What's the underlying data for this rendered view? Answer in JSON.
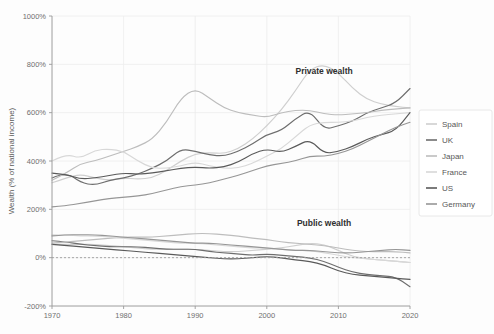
{
  "chart_data": {
    "type": "line",
    "title": "",
    "xlabel": "",
    "ylabel": "Wealth (% of national income)",
    "xlim": [
      1970,
      2020
    ],
    "ylim": [
      -200,
      1000
    ],
    "grid": true,
    "legend_position": "right",
    "x_ticks": [
      "1970",
      "1980",
      "1990",
      "2000",
      "2010",
      "2020"
    ],
    "x_tick_values": [
      1970,
      1980,
      1990,
      2000,
      2010,
      2020
    ],
    "y_ticks": [
      "-200%",
      "0%",
      "200%",
      "400%",
      "600%",
      "800%",
      "1000%"
    ],
    "y_tick_values": [
      -200,
      0,
      200,
      400,
      600,
      800,
      1000
    ],
    "annotations": [
      {
        "text": "Private wealth",
        "x": 2008,
        "y": 760
      },
      {
        "text": "Public wealth",
        "x": 2008,
        "y": 130
      }
    ],
    "zero_reference_line": 0,
    "colors": {
      "Spain": "#cfcfcf",
      "UK": "#6e6e6e",
      "Japan": "#bdbdbd",
      "France": "#d8d8d8",
      "US": "#5a5a5a",
      "Germany": "#969696"
    },
    "legend": [
      "Spain",
      "UK",
      "Japan",
      "France",
      "US",
      "Germany"
    ],
    "x": [
      1970,
      1972,
      1974,
      1976,
      1978,
      1980,
      1982,
      1984,
      1986,
      1988,
      1990,
      1992,
      1994,
      1996,
      1998,
      2000,
      2002,
      2004,
      2006,
      2008,
      2010,
      2012,
      2014,
      2016,
      2018,
      2020
    ],
    "series": [
      {
        "name": "Spain",
        "group": "private",
        "values": [
          310,
          330,
          345,
          330,
          320,
          330,
          325,
          330,
          360,
          400,
          430,
          435,
          430,
          450,
          490,
          545,
          610,
          690,
          780,
          800,
          765,
          700,
          655,
          635,
          625,
          620
        ]
      },
      {
        "name": "UK",
        "group": "private",
        "values": [
          330,
          355,
          310,
          300,
          320,
          330,
          345,
          370,
          400,
          450,
          440,
          425,
          420,
          440,
          470,
          510,
          525,
          575,
          610,
          530,
          545,
          565,
          600,
          620,
          640,
          700
        ]
      },
      {
        "name": "Japan",
        "group": "private",
        "values": [
          320,
          350,
          390,
          400,
          420,
          440,
          460,
          490,
          560,
          660,
          700,
          660,
          620,
          600,
          590,
          580,
          600,
          610,
          610,
          595,
          590,
          595,
          600,
          610,
          615,
          620
        ]
      },
      {
        "name": "France",
        "group": "private",
        "values": [
          400,
          430,
          410,
          445,
          450,
          440,
          400,
          370,
          370,
          380,
          395,
          380,
          370,
          370,
          390,
          420,
          450,
          500,
          550,
          560,
          560,
          565,
          580,
          590,
          595,
          600
        ]
      },
      {
        "name": "US",
        "group": "private",
        "values": [
          350,
          345,
          325,
          330,
          340,
          350,
          345,
          350,
          360,
          370,
          375,
          370,
          375,
          395,
          430,
          450,
          435,
          460,
          490,
          430,
          440,
          460,
          490,
          510,
          525,
          600
        ]
      },
      {
        "name": "Germany",
        "group": "private",
        "values": [
          210,
          215,
          225,
          235,
          245,
          250,
          255,
          265,
          280,
          295,
          300,
          310,
          325,
          340,
          360,
          380,
          390,
          400,
          420,
          420,
          430,
          450,
          480,
          510,
          540,
          560
        ]
      },
      {
        "name": "Spain",
        "group": "public",
        "values": [
          55,
          55,
          55,
          55,
          50,
          45,
          40,
          35,
          35,
          35,
          35,
          30,
          25,
          25,
          30,
          35,
          40,
          50,
          60,
          55,
          30,
          5,
          -5,
          -10,
          -15,
          -20
        ]
      },
      {
        "name": "UK",
        "group": "public",
        "values": [
          70,
          65,
          55,
          50,
          45,
          45,
          45,
          40,
          35,
          35,
          35,
          25,
          20,
          15,
          10,
          15,
          10,
          5,
          0,
          -15,
          -40,
          -60,
          -70,
          -75,
          -80,
          -120
        ]
      },
      {
        "name": "Japan",
        "group": "public",
        "values": [
          60,
          65,
          70,
          75,
          80,
          85,
          85,
          85,
          90,
          95,
          100,
          100,
          95,
          90,
          80,
          75,
          65,
          60,
          55,
          50,
          40,
          30,
          25,
          25,
          25,
          20
        ]
      },
      {
        "name": "France",
        "group": "public",
        "values": [
          95,
          95,
          90,
          90,
          85,
          80,
          75,
          70,
          65,
          60,
          60,
          55,
          50,
          45,
          40,
          40,
          35,
          30,
          30,
          20,
          10,
          0,
          -5,
          -10,
          -15,
          -20
        ]
      },
      {
        "name": "US",
        "group": "public",
        "values": [
          55,
          50,
          45,
          40,
          35,
          30,
          25,
          20,
          15,
          10,
          5,
          0,
          -5,
          -5,
          0,
          5,
          0,
          -10,
          -15,
          -30,
          -55,
          -70,
          -75,
          -80,
          -85,
          -90
        ]
      },
      {
        "name": "Germany",
        "group": "public",
        "values": [
          90,
          95,
          95,
          95,
          90,
          85,
          80,
          75,
          70,
          65,
          60,
          60,
          55,
          50,
          45,
          40,
          35,
          30,
          30,
          25,
          20,
          20,
          25,
          30,
          35,
          30
        ]
      }
    ]
  }
}
